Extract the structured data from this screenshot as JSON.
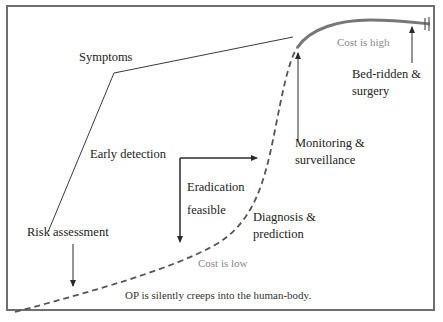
{
  "diagram": {
    "title": "",
    "labels": {
      "symptoms": "Symptoms",
      "early_detection": "Early detection",
      "eradication": "Eradication",
      "feasible": "feasible",
      "risk_assessment": "Risk assessment",
      "diagnosis": "Diagnosis &",
      "prediction": "prediction",
      "monitoring": "Monitoring &",
      "surveillance": "surveillance",
      "bed_ridden": "Bed-ridden &",
      "surgery": "surgery",
      "cost_high": "Cost is high",
      "cost_low": "Cost is low",
      "caption": "OP is silently creeps into the human-body."
    },
    "colors": {
      "line": "#3a3a3a",
      "curve": "#555555",
      "frame": "#6f6f6f",
      "cost_text": "#888888"
    }
  }
}
